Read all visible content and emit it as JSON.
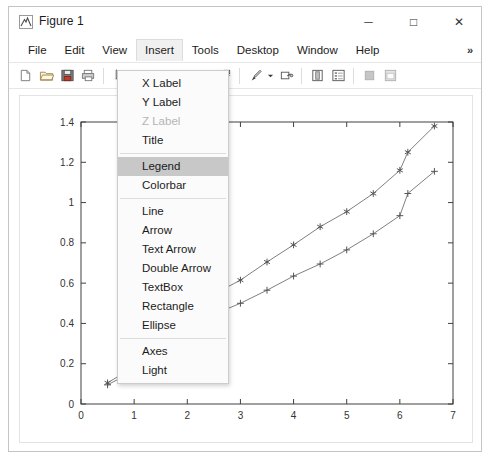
{
  "window": {
    "title": "Figure 1",
    "icon": "matlab-figure-icon",
    "controls": {
      "minimize": "─",
      "maximize": "□",
      "close": "✕"
    }
  },
  "menubar": {
    "items": [
      {
        "label": "File",
        "active": false
      },
      {
        "label": "Edit",
        "active": false
      },
      {
        "label": "View",
        "active": false
      },
      {
        "label": "Insert",
        "active": true
      },
      {
        "label": "Tools",
        "active": false
      },
      {
        "label": "Desktop",
        "active": false
      },
      {
        "label": "Window",
        "active": false
      },
      {
        "label": "Help",
        "active": false
      }
    ],
    "overflow": "»"
  },
  "toolbar": {
    "buttons": [
      {
        "name": "new-figure-icon",
        "enabled": true
      },
      {
        "name": "open-file-icon",
        "enabled": true
      },
      {
        "name": "save-figure-icon",
        "enabled": true
      },
      {
        "name": "print-figure-icon",
        "enabled": true
      },
      {
        "name": "edit-plot-arrow-icon",
        "enabled": true
      },
      {
        "name": "zoom-in-icon",
        "enabled": true
      },
      {
        "name": "zoom-out-icon",
        "enabled": true
      },
      {
        "name": "pan-icon",
        "enabled": true
      },
      {
        "name": "rotate-3d-icon",
        "enabled": true
      },
      {
        "name": "data-cursor-icon",
        "enabled": true
      },
      {
        "name": "brush-data-icon",
        "enabled": true
      },
      {
        "name": "link-plot-icon",
        "enabled": true
      },
      {
        "name": "colorbar-icon",
        "enabled": true
      },
      {
        "name": "legend-icon",
        "enabled": true
      },
      {
        "name": "hide-plot-tools-icon",
        "enabled": false
      },
      {
        "name": "show-plot-tools-icon",
        "enabled": false
      }
    ]
  },
  "insert_menu": {
    "items": [
      {
        "label": "X Label",
        "disabled": false,
        "selected": false,
        "separator_after": false
      },
      {
        "label": "Y Label",
        "disabled": false,
        "selected": false,
        "separator_after": false
      },
      {
        "label": "Z Label",
        "disabled": true,
        "selected": false,
        "separator_after": false
      },
      {
        "label": "Title",
        "disabled": false,
        "selected": false,
        "separator_after": true
      },
      {
        "label": "Legend",
        "disabled": false,
        "selected": true,
        "separator_after": false
      },
      {
        "label": "Colorbar",
        "disabled": false,
        "selected": false,
        "separator_after": true
      },
      {
        "label": "Line",
        "disabled": false,
        "selected": false,
        "separator_after": false
      },
      {
        "label": "Arrow",
        "disabled": false,
        "selected": false,
        "separator_after": false
      },
      {
        "label": "Text Arrow",
        "disabled": false,
        "selected": false,
        "separator_after": false
      },
      {
        "label": "Double Arrow",
        "disabled": false,
        "selected": false,
        "separator_after": false
      },
      {
        "label": "TextBox",
        "disabled": false,
        "selected": false,
        "separator_after": false
      },
      {
        "label": "Rectangle",
        "disabled": false,
        "selected": false,
        "separator_after": false
      },
      {
        "label": "Ellipse",
        "disabled": false,
        "selected": false,
        "separator_after": true
      },
      {
        "label": "Axes",
        "disabled": false,
        "selected": false,
        "separator_after": false
      },
      {
        "label": "Light",
        "disabled": false,
        "selected": false,
        "separator_after": false
      }
    ]
  },
  "chart_data": {
    "type": "line",
    "title": "",
    "xlabel": "",
    "ylabel": "",
    "xlim": [
      0,
      7
    ],
    "ylim": [
      0,
      1.4
    ],
    "xticks": [
      0,
      1,
      2,
      3,
      4,
      5,
      6,
      7
    ],
    "yticks": [
      0,
      0.2,
      0.4,
      0.6,
      0.8,
      1,
      1.2,
      1.4
    ],
    "xticklabels": [
      "0",
      "1",
      "2",
      "3",
      "4",
      "5",
      "6",
      "7"
    ],
    "yticklabels": [
      "0",
      "0.2",
      "0.4",
      "0.6",
      "0.8",
      "1",
      "1.2",
      "1.4"
    ],
    "grid": false,
    "legend": null,
    "line_color": "#808080",
    "marker_color": "#555555",
    "series": [
      {
        "name": "series-asterisk",
        "marker": "asterisk",
        "x": [
          0.5,
          1.0,
          2.5,
          3.0,
          3.5,
          4.0,
          4.5,
          5.0,
          5.5,
          6.0,
          6.15,
          6.65
        ],
        "y": [
          0.105,
          0.185,
          0.545,
          0.615,
          0.705,
          0.79,
          0.88,
          0.955,
          1.045,
          1.16,
          1.25,
          1.38
        ]
      },
      {
        "name": "series-plus",
        "marker": "plus",
        "x": [
          0.5,
          1.0,
          2.5,
          3.0,
          3.5,
          4.0,
          4.5,
          5.0,
          5.5,
          6.0,
          6.15,
          6.65
        ],
        "y": [
          0.095,
          0.165,
          0.445,
          0.5,
          0.565,
          0.635,
          0.695,
          0.765,
          0.845,
          0.935,
          1.045,
          1.155
        ]
      }
    ]
  }
}
